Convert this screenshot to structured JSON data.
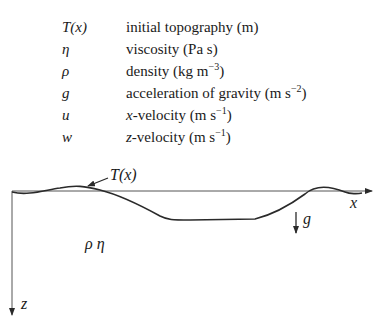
{
  "legend": {
    "rows": [
      {
        "symbol": "T(x)",
        "description": "initial topography (m)"
      },
      {
        "symbol": "η",
        "description": "viscosity (Pa s)"
      },
      {
        "symbol": "ρ",
        "description": "density (kg m",
        "sup": "−3",
        "tail": ")"
      },
      {
        "symbol": "g",
        "description": "acceleration of gravity (m s",
        "sup": "−2",
        "tail": ")"
      },
      {
        "symbol": "u",
        "description_italic": "x",
        "description": "-velocity (m s",
        "sup": "−1",
        "tail": ")"
      },
      {
        "symbol": "w",
        "description_italic": "z",
        "description": "-velocity (m s",
        "sup": "−1",
        "tail": ")"
      }
    ]
  },
  "diagram": {
    "topography_label": "T(x)",
    "x_axis_label": "x",
    "z_axis_label": "z",
    "gravity_label": "g",
    "material_label": "ρ η",
    "line_color": "#2a2a2a"
  }
}
